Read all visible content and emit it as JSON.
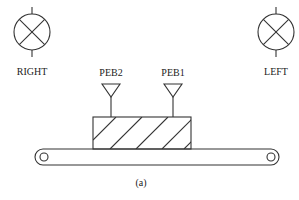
{
  "diagram": {
    "caption": "(a)",
    "lamps": [
      {
        "id": "right",
        "label": "RIGHT"
      },
      {
        "id": "left",
        "label": "LEFT"
      }
    ],
    "sensors": [
      {
        "id": "peb2",
        "label": "PEB2"
      },
      {
        "id": "peb1",
        "label": "PEB1"
      }
    ],
    "object": {
      "pattern": "diagonal-hatch"
    },
    "conveyor": {
      "rollers": 2
    },
    "colors": {
      "line": "#333333",
      "background": "#ffffff"
    }
  }
}
